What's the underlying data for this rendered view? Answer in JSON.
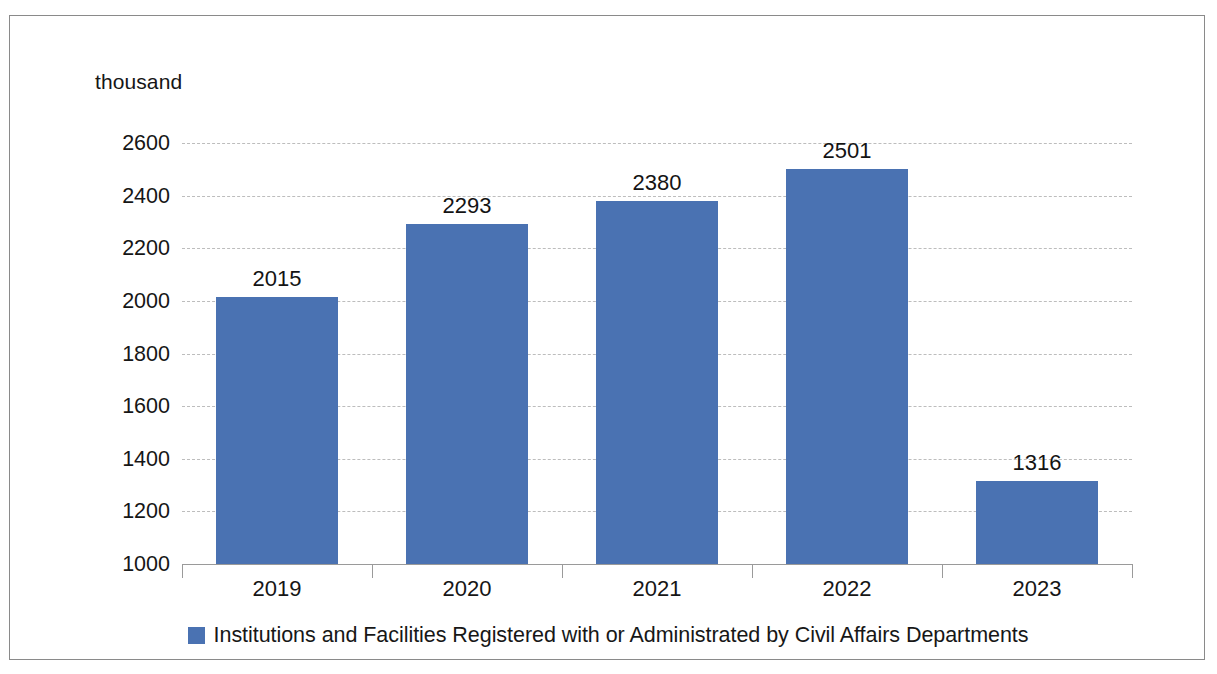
{
  "chart_data": {
    "type": "bar",
    "title": "",
    "subtitle": "",
    "unit_caption": "thousand",
    "xlabel": "",
    "ylabel": "thousand",
    "categories": [
      "2019",
      "2020",
      "2021",
      "2022",
      "2023"
    ],
    "values": [
      2015,
      2293,
      2380,
      2501,
      1316
    ],
    "data_labels": [
      "2015",
      "2293",
      "2380",
      "2501",
      "1316"
    ],
    "series": [
      {
        "name": "Institutions and Facilities Registered with or Administrated by Civil Affairs Departments",
        "values": [
          2015,
          2293,
          2380,
          2501,
          1316
        ],
        "color": "#4a72b2"
      }
    ],
    "ylim": [
      1000,
      2600
    ],
    "ytick_step": 200,
    "ytick_labels": [
      "2600",
      "2400",
      "2200",
      "2000",
      "1800",
      "1600",
      "1400",
      "1200",
      "1000"
    ],
    "ytick_values": [
      2600,
      2400,
      2200,
      2000,
      1800,
      1600,
      1400,
      1200,
      1000
    ],
    "grid": true,
    "grid_axis": "y",
    "grid_style": "dashed",
    "legend": {
      "position": "bottom",
      "entries": [
        {
          "label": "Institutions and Facilities Registered with or Administrated by Civil Affairs Departments",
          "color": "#4a72b2"
        }
      ]
    },
    "colors": {
      "bar": "#4a72b2",
      "gridline": "#bdbdbd",
      "axis": "#9a9a9a",
      "text": "#161616",
      "frame": "#8a8a8a",
      "background": "#ffffff"
    }
  }
}
